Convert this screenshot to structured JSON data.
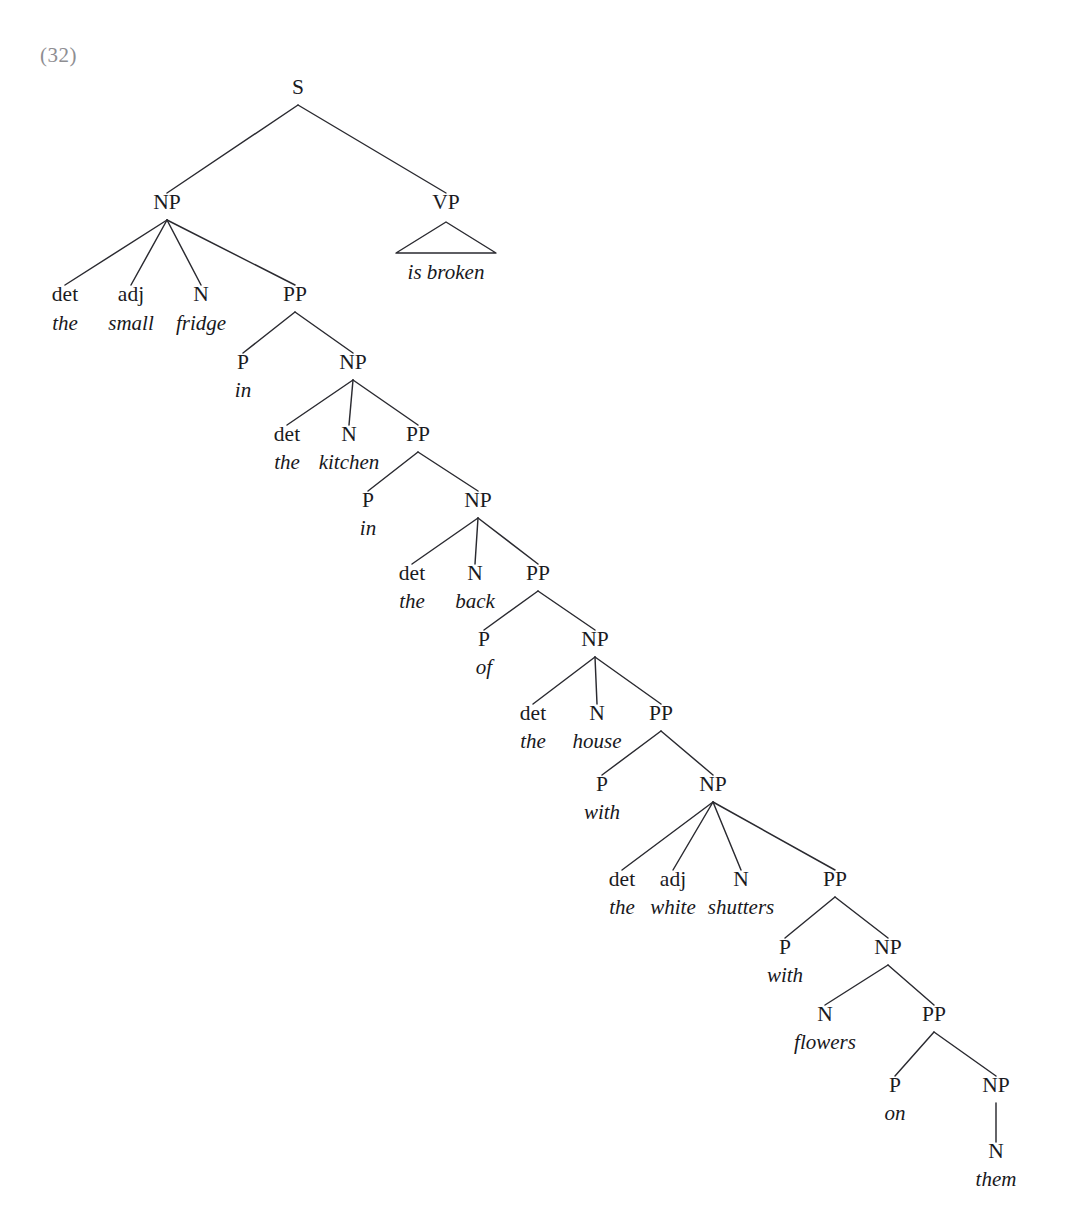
{
  "figure": {
    "example_number": "(32)",
    "type": "syntax-tree",
    "sentence": "the small fridge in the kitchen in the back of the house with the white shutters with flowers on them is broken",
    "ink_color": "#2a2a30",
    "example_number_color": "#8e8e92"
  },
  "nodes": {
    "s": {
      "label": "S",
      "x": 298,
      "y": 94
    },
    "np1": {
      "label": "NP",
      "x": 167,
      "y": 209
    },
    "vp": {
      "label": "VP",
      "x": 446,
      "y": 209
    },
    "vp_terminal": {
      "label": "is broken",
      "x": 446,
      "y": 279
    },
    "np1_det": {
      "label": "det",
      "x": 65,
      "y": 301
    },
    "np1_det_t": {
      "label": "the",
      "x": 65,
      "y": 330
    },
    "np1_adj": {
      "label": "adj",
      "x": 131,
      "y": 301
    },
    "np1_adj_t": {
      "label": "small",
      "x": 131,
      "y": 330
    },
    "np1_n": {
      "label": "N",
      "x": 201,
      "y": 301
    },
    "np1_n_t": {
      "label": "fridge",
      "x": 201,
      "y": 330
    },
    "pp1": {
      "label": "PP",
      "x": 295,
      "y": 301
    },
    "pp1_p": {
      "label": "P",
      "x": 243,
      "y": 369
    },
    "pp1_p_t": {
      "label": "in",
      "x": 243,
      "y": 397
    },
    "np2": {
      "label": "NP",
      "x": 353,
      "y": 369
    },
    "np2_det": {
      "label": "det",
      "x": 287,
      "y": 441
    },
    "np2_det_t": {
      "label": "the",
      "x": 287,
      "y": 469
    },
    "np2_n": {
      "label": "N",
      "x": 349,
      "y": 441
    },
    "np2_n_t": {
      "label": "kitchen",
      "x": 349,
      "y": 469
    },
    "pp2": {
      "label": "PP",
      "x": 418,
      "y": 441
    },
    "pp2_p": {
      "label": "P",
      "x": 368,
      "y": 507
    },
    "pp2_p_t": {
      "label": "in",
      "x": 368,
      "y": 535
    },
    "np3": {
      "label": "NP",
      "x": 478,
      "y": 507
    },
    "np3_det": {
      "label": "det",
      "x": 412,
      "y": 580
    },
    "np3_det_t": {
      "label": "the",
      "x": 412,
      "y": 608
    },
    "np3_n": {
      "label": "N",
      "x": 475,
      "y": 580
    },
    "np3_n_t": {
      "label": "back",
      "x": 475,
      "y": 608
    },
    "pp3": {
      "label": "PP",
      "x": 538,
      "y": 580
    },
    "pp3_p": {
      "label": "P",
      "x": 484,
      "y": 646
    },
    "pp3_p_t": {
      "label": "of",
      "x": 484,
      "y": 674
    },
    "np4": {
      "label": "NP",
      "x": 595,
      "y": 646
    },
    "np4_det": {
      "label": "det",
      "x": 533,
      "y": 720
    },
    "np4_det_t": {
      "label": "the",
      "x": 533,
      "y": 748
    },
    "np4_n": {
      "label": "N",
      "x": 597,
      "y": 720
    },
    "np4_n_t": {
      "label": "house",
      "x": 597,
      "y": 748
    },
    "pp4": {
      "label": "PP",
      "x": 661,
      "y": 720
    },
    "pp4_p": {
      "label": "P",
      "x": 602,
      "y": 791
    },
    "pp4_p_t": {
      "label": "with",
      "x": 602,
      "y": 819
    },
    "np5": {
      "label": "NP",
      "x": 713,
      "y": 791
    },
    "np5_det": {
      "label": "det",
      "x": 622,
      "y": 886
    },
    "np5_det_t": {
      "label": "the",
      "x": 622,
      "y": 914
    },
    "np5_adj": {
      "label": "adj",
      "x": 673,
      "y": 886
    },
    "np5_adj_t": {
      "label": "white",
      "x": 673,
      "y": 914
    },
    "np5_n": {
      "label": "N",
      "x": 741,
      "y": 886
    },
    "np5_n_t": {
      "label": "shutters",
      "x": 741,
      "y": 914
    },
    "pp5": {
      "label": "PP",
      "x": 835,
      "y": 886
    },
    "pp5_p": {
      "label": "P",
      "x": 785,
      "y": 954
    },
    "pp5_p_t": {
      "label": "with",
      "x": 785,
      "y": 982
    },
    "np6": {
      "label": "NP",
      "x": 888,
      "y": 954
    },
    "np6_n": {
      "label": "N",
      "x": 825,
      "y": 1021
    },
    "np6_n_t": {
      "label": "flowers",
      "x": 825,
      "y": 1049
    },
    "pp6": {
      "label": "PP",
      "x": 934,
      "y": 1021
    },
    "pp6_p": {
      "label": "P",
      "x": 895,
      "y": 1092
    },
    "pp6_p_t": {
      "label": "on",
      "x": 895,
      "y": 1120
    },
    "np7": {
      "label": "NP",
      "x": 996,
      "y": 1092
    },
    "np7_n": {
      "label": "N",
      "x": 996,
      "y": 1158
    },
    "np7_n_t": {
      "label": "them",
      "x": 996,
      "y": 1186
    }
  },
  "edges": [
    {
      "from": "s",
      "to": "np1"
    },
    {
      "from": "s",
      "to": "vp"
    },
    {
      "from": "np1",
      "to": "np1_det"
    },
    {
      "from": "np1",
      "to": "np1_adj"
    },
    {
      "from": "np1",
      "to": "np1_n"
    },
    {
      "from": "np1",
      "to": "pp1"
    },
    {
      "from": "pp1",
      "to": "pp1_p"
    },
    {
      "from": "pp1",
      "to": "np2"
    },
    {
      "from": "np2",
      "to": "np2_det"
    },
    {
      "from": "np2",
      "to": "np2_n"
    },
    {
      "from": "np2",
      "to": "pp2"
    },
    {
      "from": "pp2",
      "to": "pp2_p"
    },
    {
      "from": "pp2",
      "to": "np3"
    },
    {
      "from": "np3",
      "to": "np3_det"
    },
    {
      "from": "np3",
      "to": "np3_n"
    },
    {
      "from": "np3",
      "to": "pp3"
    },
    {
      "from": "pp3",
      "to": "pp3_p"
    },
    {
      "from": "pp3",
      "to": "np4"
    },
    {
      "from": "np4",
      "to": "np4_det"
    },
    {
      "from": "np4",
      "to": "np4_n"
    },
    {
      "from": "np4",
      "to": "pp4"
    },
    {
      "from": "pp4",
      "to": "pp4_p"
    },
    {
      "from": "pp4",
      "to": "np5"
    },
    {
      "from": "np5",
      "to": "np5_det"
    },
    {
      "from": "np5",
      "to": "np5_adj"
    },
    {
      "from": "np5",
      "to": "np5_n"
    },
    {
      "from": "np5",
      "to": "pp5"
    },
    {
      "from": "pp5",
      "to": "pp5_p"
    },
    {
      "from": "pp5",
      "to": "np6"
    },
    {
      "from": "np6",
      "to": "np6_n"
    },
    {
      "from": "np6",
      "to": "pp6"
    },
    {
      "from": "pp6",
      "to": "pp6_p"
    },
    {
      "from": "pp6",
      "to": "np7"
    },
    {
      "from": "np7",
      "to": "np7_n"
    }
  ],
  "triangle": {
    "parent": "vp",
    "apex_x": 446,
    "apex_y": 222,
    "left_x": 396,
    "right_x": 496,
    "base_y": 253
  },
  "example_number_position": {
    "x": 40,
    "y": 62
  }
}
